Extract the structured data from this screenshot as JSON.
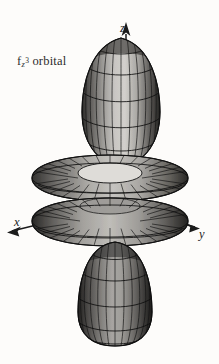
{
  "figure": {
    "kind": "atomic-orbital-wireframe-diagram",
    "background_color": "#fdfcfa",
    "line_color": "#1a1a1a",
    "surface_light": "#cfcdc9",
    "surface_mid": "#8d8b88",
    "surface_dark": "#3a3937"
  },
  "label": {
    "base": "f",
    "subscript": "z",
    "superscript": "3",
    "suffix": "orbital",
    "full_text": "fz3 orbital"
  },
  "axes": {
    "z": {
      "label": "z",
      "direction": "up"
    },
    "x": {
      "label": "x",
      "direction": "down-left"
    },
    "y": {
      "label": "y",
      "direction": "down-right"
    }
  },
  "shapes": {
    "top_lobe": {
      "name": "top-lobe",
      "type": "ovoid",
      "cx": 121,
      "top": 38,
      "bottom": 166,
      "half_width": 39
    },
    "upper_torus": {
      "name": "upper-torus",
      "type": "torus",
      "cx": 110,
      "cy": 178,
      "outer_rx": 78,
      "outer_ry": 23
    },
    "lower_torus": {
      "name": "lower-torus",
      "type": "torus",
      "cx": 110,
      "cy": 222,
      "outer_rx": 78,
      "outer_ry": 24
    },
    "bottom_lobe": {
      "name": "bottom-lobe",
      "type": "ovoid",
      "cx": 115,
      "top": 242,
      "bottom": 346,
      "half_width": 37
    }
  }
}
